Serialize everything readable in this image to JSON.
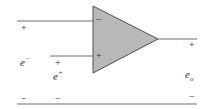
{
  "diagram": {
    "type": "op-amp-schematic",
    "colors": {
      "wire": "#707070",
      "triangle_fill": "#b8b8b8",
      "triangle_stroke": "#505050",
      "text": "#333333"
    },
    "opamp": {
      "inverting_input_sign": "−",
      "noninverting_input_sign": "+"
    },
    "labels": {
      "left_top_sign": "+",
      "e_minus_base": "e",
      "e_minus_sup": "−",
      "mid_plus_sign": "+",
      "e_plus_base": "e",
      "e_plus_sup": "+",
      "left_bottom_sign": "−",
      "mid_bottom_sign": "−",
      "out_plus_sign": "+",
      "e_out_base": "e",
      "e_out_sub": "o",
      "out_minus_sign": "−"
    }
  }
}
